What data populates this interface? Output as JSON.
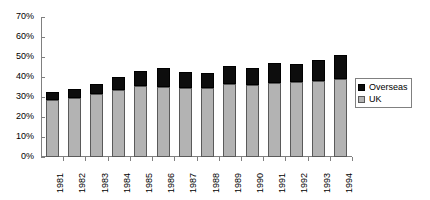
{
  "chart_data": {
    "type": "bar",
    "stacked": true,
    "title": "",
    "subtitle": "",
    "xlabel": "",
    "ylabel": "",
    "ylim": [
      0,
      70
    ],
    "ytick_labels": [
      "0%",
      "10%",
      "20%",
      "30%",
      "40%",
      "50%",
      "60%",
      "70%"
    ],
    "ytick_values": [
      0,
      10,
      20,
      30,
      40,
      50,
      60,
      70
    ],
    "grid": false,
    "legend_position": "right",
    "categories": [
      "1981",
      "1982",
      "1983",
      "1984",
      "1985",
      "1986",
      "1987",
      "1988",
      "1989",
      "1990",
      "1991",
      "1992",
      "1993",
      "1994"
    ],
    "series": [
      {
        "name": "UK",
        "color": "#b3b3b3",
        "values": [
          28.5,
          29.5,
          31.5,
          33.5,
          35.5,
          35.0,
          34.5,
          34.5,
          36.5,
          36.0,
          37.0,
          37.5,
          38.0,
          39.0
        ]
      },
      {
        "name": "Overseas",
        "color": "#000000",
        "values": [
          4.0,
          4.5,
          5.0,
          6.5,
          7.5,
          9.5,
          8.0,
          7.5,
          9.0,
          8.5,
          10.0,
          9.0,
          10.5,
          12.0
        ]
      }
    ],
    "totals": [
      32.5,
      34.0,
      36.5,
      40.0,
      43.0,
      44.5,
      42.5,
      42.0,
      45.5,
      44.5,
      47.0,
      46.5,
      48.5,
      51.0
    ]
  },
  "legend": {
    "entries": [
      {
        "label": "Overseas",
        "swatch": "black-square-swatch"
      },
      {
        "label": "UK",
        "swatch": "gray-square-swatch"
      }
    ]
  }
}
